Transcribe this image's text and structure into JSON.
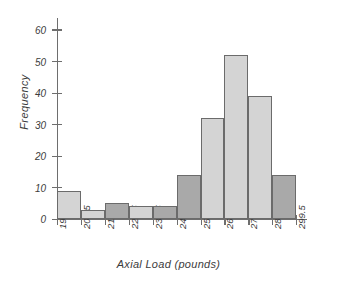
{
  "chart_data": {
    "type": "bar",
    "title": "",
    "xlabel": "Axial Load (pounds)",
    "ylabel": "Frequency",
    "categories": [
      "199.5-209.5",
      "209.5-219.5",
      "219.5-229.5",
      "229.5-239.5",
      "239.5-249.5",
      "249.5-259.5",
      "259.5-269.5",
      "269.5-279.5",
      "279.5-289.5",
      "289.5-299.5"
    ],
    "values": [
      9,
      3,
      5,
      4,
      4,
      14,
      32,
      52,
      39,
      14
    ],
    "bin_edges": [
      199.5,
      209.5,
      219.5,
      229.5,
      239.5,
      249.5,
      259.5,
      269.5,
      279.5,
      289.5,
      299.5
    ],
    "xtick_labels": [
      "199.5",
      "209.5",
      "219.5",
      "229.5",
      "239.5",
      "249.5",
      "259.5",
      "269.5",
      "279.5",
      "289.5",
      "299.5"
    ],
    "ytick_labels": [
      "0",
      "10",
      "20",
      "30",
      "40",
      "50",
      "60"
    ],
    "yticks": [
      0,
      10,
      20,
      30,
      40,
      50,
      60
    ],
    "ylim": [
      0,
      64
    ],
    "grid": false,
    "legend": "none",
    "bar_fills": [
      "light",
      "light",
      "dark",
      "light",
      "dark",
      "dark",
      "light",
      "light",
      "light",
      "dark"
    ],
    "colors": {
      "bar_light": "#d4d4d4",
      "bar_dark": "#a9a9a9",
      "bar_edge": "#6b6b6b",
      "axis": "#6e6e6e",
      "text": "#3c3c3c",
      "background": "#ffffff"
    }
  }
}
